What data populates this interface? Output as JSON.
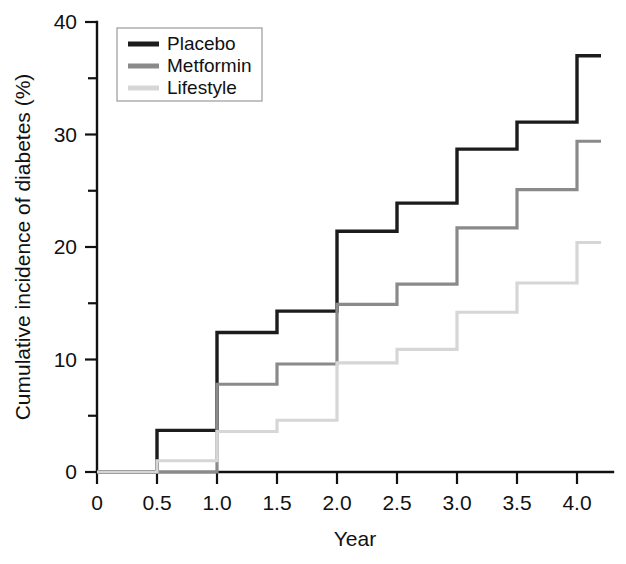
{
  "chart_data": {
    "type": "line",
    "subtype": "step",
    "title": "",
    "xlabel": "Year",
    "ylabel": "Cumulative incidence of diabetes (%)",
    "xlim": [
      0,
      4.3
    ],
    "ylim": [
      0,
      40
    ],
    "grid": false,
    "legend_position": "top-left-inside",
    "x_ticks": [
      0,
      0.5,
      1.0,
      1.5,
      2.0,
      2.5,
      3.0,
      3.5,
      4.0
    ],
    "x_tick_labels": [
      "0",
      "0.5",
      "1.0",
      "1.5",
      "2.0",
      "2.5",
      "3.0",
      "3.5",
      "4.0"
    ],
    "y_ticks": [
      0,
      10,
      20,
      30,
      40
    ],
    "y_tick_labels": [
      "0",
      "10",
      "20",
      "30",
      "40"
    ],
    "y_minor_ticks": [
      5,
      15,
      25,
      35
    ],
    "x": [
      0,
      0.5,
      1.0,
      1.5,
      2.0,
      2.5,
      3.0,
      3.5,
      4.0,
      4.2
    ],
    "series": [
      {
        "name": "Placebo",
        "color": "#1c1c1c",
        "width": 3.4,
        "values": [
          0,
          3.7,
          12.4,
          14.3,
          21.4,
          23.9,
          28.7,
          31.1,
          37.0,
          37.0
        ]
      },
      {
        "name": "Metformin",
        "color": "#8a8a8a",
        "width": 3.2,
        "values": [
          0,
          0,
          7.8,
          9.6,
          14.9,
          16.7,
          21.7,
          25.1,
          29.4,
          29.4
        ]
      },
      {
        "name": "Lifestyle",
        "color": "#d6d6d6",
        "width": 3.2,
        "values": [
          0,
          1.0,
          3.6,
          4.6,
          9.7,
          10.9,
          14.2,
          16.8,
          20.4,
          20.4
        ]
      }
    ]
  },
  "legend": {
    "entries": [
      {
        "label": "Placebo"
      },
      {
        "label": "Metformin"
      },
      {
        "label": "Lifestyle"
      }
    ]
  }
}
